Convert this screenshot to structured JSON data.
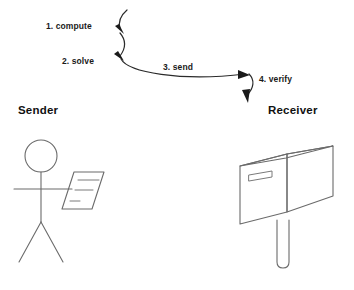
{
  "diagram": {
    "background_color": "#ffffff",
    "line_color": "#6b6b6b",
    "arrow_color": "#1a1a1a",
    "text_color": "#111111"
  },
  "steps": [
    {
      "id": "step-1",
      "label": "1. compute",
      "x": 46,
      "y": 26
    },
    {
      "id": "step-2",
      "label": "2. solve",
      "x": 62,
      "y": 61
    },
    {
      "id": "step-3",
      "label": "3. send",
      "x": 163,
      "y": 67
    },
    {
      "id": "step-4",
      "label": "4. verify",
      "x": 256,
      "y": 79
    }
  ],
  "actors": [
    {
      "id": "sender",
      "label": "Sender",
      "x": 18,
      "y": 110,
      "figure": "stick-figure-with-document"
    },
    {
      "id": "receiver",
      "label": "Receiver",
      "x": 268,
      "y": 110,
      "figure": "mailbox-on-post"
    }
  ]
}
